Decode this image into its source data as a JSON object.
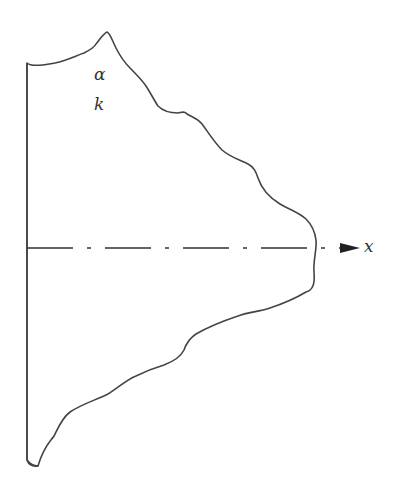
{
  "diagram": {
    "type": "cross-section body with symmetry axis",
    "labels": {
      "alpha": "α",
      "k": "k",
      "axis": "x"
    },
    "colors": {
      "stroke": "#444444",
      "background": "#ffffff"
    },
    "axis": {
      "style": "dash-dot",
      "direction": "right",
      "arrowhead": true
    }
  }
}
